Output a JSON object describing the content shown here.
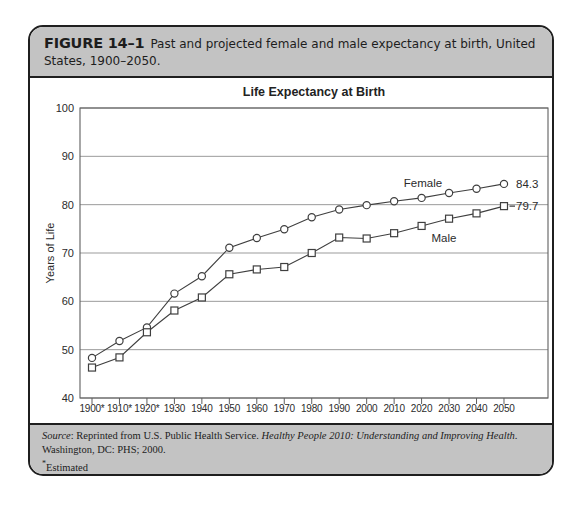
{
  "figure_header": {
    "label": "FIGURE 14–1",
    "caption": "Past and projected female and male expectancy at birth, United States, 1900–2050."
  },
  "chart_data": {
    "type": "line",
    "title": "Life Expectancy at Birth",
    "ylabel": "Years of Life",
    "xlabel": "",
    "ylim": [
      40,
      100
    ],
    "yticks": [
      40,
      50,
      60,
      70,
      80,
      90,
      100
    ],
    "grid": "horizontal",
    "legend_position": "inline-annotations",
    "categories": [
      "1900*",
      "1910*",
      "1920*",
      "1930",
      "1940",
      "1950",
      "1960",
      "1970",
      "1980",
      "1990",
      "2000",
      "2010",
      "2020",
      "2030",
      "2040",
      "2050"
    ],
    "series": [
      {
        "name": "Female",
        "marker": "circle",
        "end_label": "84.3",
        "end_dash": false,
        "values": [
          48.3,
          51.8,
          54.6,
          61.6,
          65.2,
          71.1,
          73.1,
          74.9,
          77.4,
          79.0,
          79.9,
          80.7,
          81.4,
          82.4,
          83.3,
          84.3
        ]
      },
      {
        "name": "Male",
        "marker": "square",
        "end_label": "79.7",
        "end_dash": true,
        "values": [
          46.3,
          48.4,
          53.6,
          58.1,
          60.8,
          65.6,
          66.6,
          67.1,
          70.0,
          73.2,
          73.0,
          74.1,
          75.6,
          77.1,
          78.2,
          79.7
        ]
      }
    ],
    "colors": {
      "line": "#3f3f3f",
      "marker_fill": "#ffffff",
      "grid": "#909090",
      "plot_border": "#5f5f5f",
      "text": "#2b2b2b"
    }
  },
  "footer": {
    "source_label": "Source",
    "source_text_1": ": Reprinted from U.S. Public Health Service. ",
    "source_title_italic": "Healthy People 2010: Understanding and Improving Health",
    "source_text_2": ". Washington, DC: PHS; 2000.",
    "estimated_marker": "*",
    "estimated_text": "Estimated"
  },
  "theme": {
    "band_gray": "#c3c3c3",
    "border_black": "#1f1f1f"
  }
}
